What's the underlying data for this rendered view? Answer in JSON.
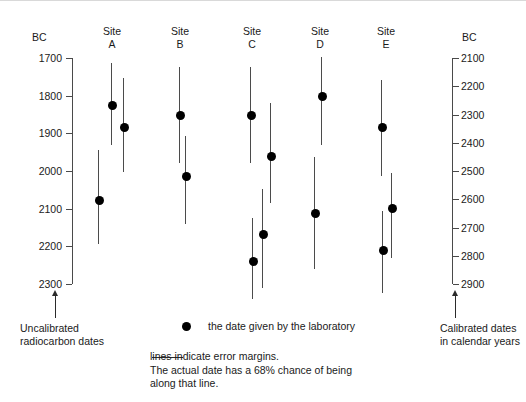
{
  "chart_data": {
    "type": "scatter",
    "title": "",
    "orientation": "vertical-dates-descending",
    "left_axis": {
      "label": "BC",
      "caption": "Uncalibrated\nradiocarbon dates",
      "ticks": [
        1700,
        1800,
        1900,
        2000,
        2100,
        2200,
        2300
      ],
      "ticklabels": [
        "1700",
        "1800",
        "1900",
        "2000",
        "2100",
        "2200",
        "2300"
      ],
      "range": [
        1700,
        2300
      ]
    },
    "right_axis": {
      "label": "BC",
      "caption": "Calibrated dates\nin calendar years",
      "ticks": [
        2100,
        2200,
        2300,
        2400,
        2500,
        2600,
        2700,
        2800,
        2900
      ],
      "ticklabels": [
        "2100",
        "2200",
        "2300",
        "2400",
        "2500",
        "2600",
        "2700",
        "2800",
        "2900"
      ],
      "range": [
        2100,
        2900
      ]
    },
    "grid": false,
    "legend_position": "bottom",
    "series": [
      {
        "name": "Site\nA",
        "label_x": 112,
        "points": [
          {
            "x": 111,
            "date": 1825,
            "low": 1713,
            "high": 1932
          },
          {
            "x": 123,
            "date": 1882,
            "low": 1753,
            "high": 2003
          },
          {
            "x": 98,
            "date": 2078,
            "low": 1945,
            "high": 2193
          }
        ]
      },
      {
        "name": "Site\nB",
        "label_x": 180,
        "points": [
          {
            "x": 179,
            "date": 1852,
            "low": 1724,
            "high": 1980
          },
          {
            "x": 185,
            "date": 2012,
            "low": 1908,
            "high": 2140
          }
        ]
      },
      {
        "name": "Site\nC",
        "label_x": 252,
        "points": [
          {
            "x": 250,
            "date": 1852,
            "low": 1724,
            "high": 1980
          },
          {
            "x": 270,
            "date": 1959,
            "low": 1820,
            "high": 2084
          },
          {
            "x": 262,
            "date": 2167,
            "low": 2047,
            "high": 2311
          },
          {
            "x": 252,
            "date": 2239,
            "low": 2124,
            "high": 2340
          }
        ]
      },
      {
        "name": "Site\nD",
        "label_x": 320,
        "points": [
          {
            "x": 321,
            "date": 1801,
            "low": 1697,
            "high": 1932
          },
          {
            "x": 314,
            "date": 2111,
            "low": 1964,
            "high": 2260
          }
        ]
      },
      {
        "name": "Site\nE",
        "label_x": 386,
        "points": [
          {
            "x": 381,
            "date": 1884,
            "low": 1759,
            "high": 2012
          },
          {
            "x": 391,
            "date": 2097,
            "low": 2004,
            "high": 2231
          },
          {
            "x": 382,
            "date": 2209,
            "low": 2105,
            "high": 2324
          }
        ]
      }
    ],
    "legend": [
      {
        "marker": "dot",
        "text": "the date given by the laboratory"
      },
      {
        "marker": "line",
        "text": "lines indicate error margins.\nThe actual date has a 68% chance of being\nalong that line."
      }
    ]
  },
  "colors": {
    "marker": "#000000",
    "errorbar": "#4b4b4b",
    "axis": "#4a4a4a",
    "text": "#1a1a1a",
    "background": "#ffffff"
  }
}
